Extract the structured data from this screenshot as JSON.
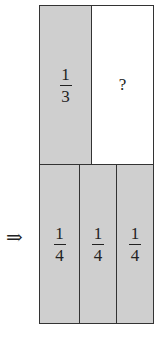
{
  "top_row": {
    "left": {
      "numerator": "1",
      "denominator": "3",
      "shaded": true
    },
    "right": {
      "label": "?",
      "shaded": false
    }
  },
  "bottom_row": {
    "cells": [
      {
        "numerator": "1",
        "denominator": "4"
      },
      {
        "numerator": "1",
        "denominator": "4"
      },
      {
        "numerator": "1",
        "denominator": "4"
      }
    ]
  },
  "arrow": "⇒",
  "colors": {
    "shade": "#cfcfcf",
    "border": "#333333"
  }
}
